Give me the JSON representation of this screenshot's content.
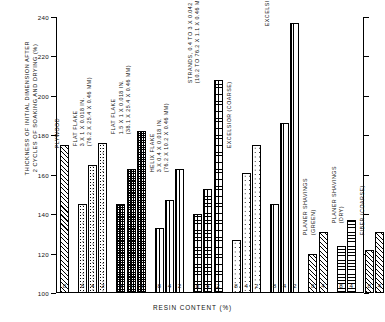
{
  "chart_data": {
    "type": "bar",
    "title": "",
    "xlabel": "RESIN CONTENT (%)",
    "ylabel": "THICKNESS OF INITIAL DIMENSION AFTER\n2 CYCLES OF SOAKING AND DRYING (%)",
    "ylim": [
      100,
      240
    ],
    "yticks": [
      100,
      120,
      140,
      160,
      180,
      200,
      220,
      240
    ],
    "ytick_labels": [
      "100",
      "120",
      "140",
      "160",
      "180",
      "200",
      "220",
      "240"
    ],
    "grid": false,
    "legend": "none",
    "groups": [
      {
        "label": "PLYWOOD",
        "sublabels": [],
        "pattern": "diagonal-hatch",
        "categories": [
          "8"
        ],
        "values": [
          175
        ]
      },
      {
        "label": "FLAT FLAKE",
        "sublabels": [
          "3 X 1 X 0.018 IN.",
          "(76.2 X 25.4 X 0.46 MM)"
        ],
        "pattern": "speckle",
        "categories": [
          "8",
          "4",
          "2"
        ],
        "values": [
          145,
          165,
          176
        ]
      },
      {
        "label": "FLAT FLAKE",
        "sublabels": [
          "1.5 X 1 X 0.018 IN.",
          "(38.1 X 25.4 X 0.46 MM)"
        ],
        "pattern": "checker",
        "categories": [
          "8",
          "4",
          "2"
        ],
        "values": [
          145,
          163,
          182
        ]
      },
      {
        "label": "HELIX FLAKE",
        "sublabels": [
          "3 X 0.4 X 0.018 IN.",
          "(76.2 X 10.2 X 0.46 MM)"
        ],
        "pattern": "vertical-line",
        "categories": [
          "8",
          "4",
          "2"
        ],
        "values": [
          133,
          147,
          163
        ]
      },
      {
        "label": "STRANDS, 0.4 TO 3 X 0.042 X 0.018 IN.",
        "sublabels": [
          "(10.2 TO 76.2 X 1.1 X 0.46 MM)"
        ],
        "pattern": "grid-mesh",
        "categories": [
          "8",
          "4",
          "2"
        ],
        "values": [
          140,
          153,
          208
        ]
      },
      {
        "label": "EXCELSIOR (COARSE)",
        "sublabels": [],
        "pattern": "coarse-speckle",
        "categories": [
          "8",
          "4",
          "2"
        ],
        "values": [
          127,
          161,
          175
        ]
      },
      {
        "label": "EXCELSIOR (FINE)",
        "sublabels": [],
        "pattern": "fine-vertical",
        "categories": [
          "8",
          "4",
          "2"
        ],
        "values": [
          145,
          186,
          237
        ]
      },
      {
        "label": "PLANER SHAVINGS",
        "sublabels": [
          "(GREEN)"
        ],
        "pattern": "diagonal-hatch",
        "categories": [
          "8",
          "4"
        ],
        "values": [
          120,
          131
        ]
      },
      {
        "label": "PLANER SHAVINGS",
        "sublabels": [
          "(DRY)"
        ],
        "pattern": "horizontal-line",
        "categories": [
          "8",
          "4"
        ],
        "values": [
          124,
          137
        ]
      },
      {
        "label": "FIBER (COARSE)",
        "sublabels": [],
        "pattern": "diagonal-hatch",
        "categories": [
          "8",
          "4"
        ],
        "values": [
          122,
          131
        ]
      }
    ]
  }
}
